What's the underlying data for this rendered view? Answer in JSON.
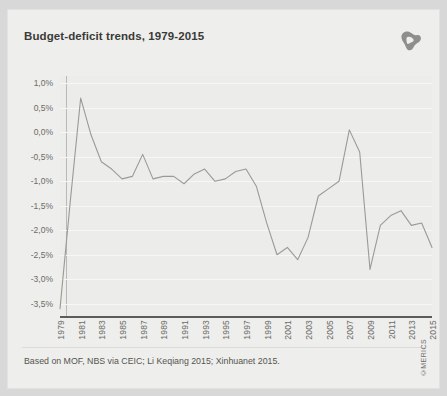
{
  "card": {
    "background_color": "#eeeeec",
    "plot_background_color": "#ececea"
  },
  "title": "Budget-deficit trends, 1979-2015",
  "logo": {
    "name": "merics-logo",
    "color": "#8c8c88"
  },
  "footnote": "Based on MOF, NBS via CEIC; Li Keqiang 2015; Xinhuanet 2015.",
  "credit": "©MERICS",
  "chart_data": {
    "type": "line",
    "title": "Budget-deficit trends, 1979-2015",
    "xlabel": "",
    "ylabel": "",
    "line_color": "#9a9a96",
    "grid": true,
    "legend": "none",
    "ylim": [
      -3.75,
      1.15
    ],
    "yticks": [
      1.0,
      0.5,
      0.0,
      -0.5,
      -1.0,
      -1.5,
      -2.0,
      -2.5,
      -3.0,
      -3.5
    ],
    "ytick_labels": [
      "1,0%",
      "0,5%",
      "0,0%",
      "-0,5%",
      "-1,0%",
      "-1,5%",
      "-2,0%",
      "-2,5%",
      "-3,0%",
      "-3,5%"
    ],
    "xticks": [
      1979,
      1981,
      1983,
      1985,
      1987,
      1989,
      1991,
      1993,
      1995,
      1997,
      1999,
      2001,
      2003,
      2005,
      2007,
      2009,
      2011,
      2013,
      2015
    ],
    "xtick_labels": [
      "1979",
      "1981",
      "1983",
      "1985",
      "1987",
      "1989",
      "1991",
      "1993",
      "1995",
      "1997",
      "1999",
      "2001",
      "2003",
      "2005",
      "2007",
      "2009",
      "2011",
      "2013",
      "2015"
    ],
    "xlim": [
      1979,
      2015
    ],
    "x": [
      1979,
      1980,
      1981,
      1982,
      1983,
      1984,
      1985,
      1986,
      1987,
      1988,
      1989,
      1990,
      1991,
      1992,
      1993,
      1994,
      1995,
      1996,
      1997,
      1998,
      1999,
      2000,
      2001,
      2002,
      2003,
      2004,
      2005,
      2006,
      2007,
      2008,
      2009,
      2010,
      2011,
      2012,
      2013,
      2014,
      2015
    ],
    "values": [
      -3.6,
      -1.4,
      0.7,
      -0.05,
      -0.6,
      -0.75,
      -0.95,
      -0.9,
      -0.45,
      -0.95,
      -0.9,
      -0.9,
      -1.05,
      -0.85,
      -0.75,
      -1.0,
      -0.95,
      -0.8,
      -0.75,
      -1.1,
      -1.85,
      -2.5,
      -2.35,
      -2.6,
      -2.15,
      -1.3,
      -1.15,
      -1.0,
      0.05,
      -0.4,
      -2.8,
      -1.9,
      -1.7,
      -1.6,
      -1.9,
      -1.85,
      -2.35
    ],
    "series": [
      {
        "name": "Budget deficit (% of GDP)",
        "values": [
          -3.6,
          -1.4,
          0.7,
          -0.05,
          -0.6,
          -0.75,
          -0.95,
          -0.9,
          -0.45,
          -0.95,
          -0.9,
          -0.9,
          -1.05,
          -0.85,
          -0.75,
          -1.0,
          -0.95,
          -0.8,
          -0.75,
          -1.1,
          -1.85,
          -2.5,
          -2.35,
          -2.6,
          -2.15,
          -1.3,
          -1.15,
          -1.0,
          0.05,
          -0.4,
          -2.8,
          -1.9,
          -1.7,
          -1.6,
          -1.9,
          -1.85,
          -2.35
        ]
      }
    ]
  }
}
